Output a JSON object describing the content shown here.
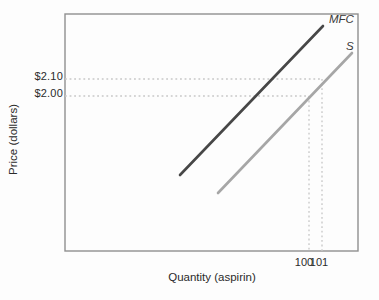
{
  "figure": {
    "background": "#fdfdfd",
    "axis_color": "#8f8f8f",
    "guide_color": "#c7c7c7",
    "text_color": "#2b2b2b"
  },
  "chart_data": {
    "type": "line",
    "title": "",
    "xlabel": "Quantity (aspirin)",
    "ylabel": "Price (dollars)",
    "x_tick_labels": [
      "100",
      "101"
    ],
    "y_tick_labels": [
      "$2.10",
      "$2.00"
    ],
    "grid": "off",
    "legend": "none; curves labeled inline at upper right",
    "plot_px": {
      "left": 65,
      "top": 14,
      "right": 358,
      "bottom": 251
    },
    "series": [
      {
        "name": "MFC",
        "label": "MFC",
        "color": "#474747",
        "width": 2.6,
        "shape": "straight upward-sloping line",
        "points_px": [
          [
            180,
            175
          ],
          [
            323,
            26
          ]
        ]
      },
      {
        "name": "S",
        "label": "S",
        "color": "#a6a6a6",
        "width": 2.6,
        "shape": "straight upward-sloping line",
        "passes_through": [
          [
            100,
            2.0
          ],
          [
            101,
            2.1
          ]
        ],
        "points_px": [
          [
            218,
            193
          ],
          [
            352,
            53
          ]
        ]
      }
    ],
    "reference_points": [
      {
        "quantity": 101,
        "price": 2.1,
        "px": [
          322,
          79
        ]
      },
      {
        "quantity": 100,
        "price": 2.0,
        "px": [
          309,
          96
        ]
      }
    ]
  }
}
